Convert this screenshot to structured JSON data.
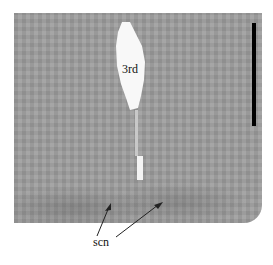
{
  "figure": {
    "type": "grayscale brain section image",
    "labels": {
      "third_ventricle": "3rd",
      "suprachiasmatic_nucleus": "scn"
    },
    "scale_bar": {
      "color": "#000000",
      "orientation": "vertical"
    },
    "colors": {
      "tissue": "#9d9d9d",
      "ventricle": "#f8f8f8",
      "background": "#ffffff"
    }
  }
}
